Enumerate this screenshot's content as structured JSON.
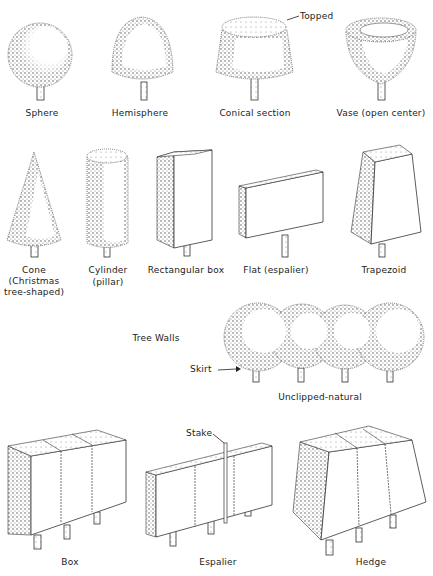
{
  "diagram": {
    "rows": [
      {
        "row": 1,
        "shapes": [
          {
            "id": "sphere",
            "label": "Sphere"
          },
          {
            "id": "hemisphere",
            "label": "Hemisphere"
          },
          {
            "id": "conical-section",
            "label": "Conical section",
            "callout": "Topped"
          },
          {
            "id": "vase",
            "label": "Vase (open center)"
          }
        ]
      },
      {
        "row": 2,
        "shapes": [
          {
            "id": "cone",
            "label": "Cone",
            "sublabel1": "(Christmas",
            "sublabel2": "tree-shaped)"
          },
          {
            "id": "cylinder",
            "label": "Cylinder",
            "sublabel1": "(pillar)"
          },
          {
            "id": "rectangular-box",
            "label": "Rectangular box"
          },
          {
            "id": "flat",
            "label": "Flat (espalier)"
          },
          {
            "id": "trapezoid",
            "label": "Trapezoid"
          }
        ]
      },
      {
        "row": 3,
        "section_title": "Tree Walls",
        "shapes": [
          {
            "id": "unclipped-natural",
            "label": "Unclipped-natural",
            "callout": "Skirt"
          }
        ]
      },
      {
        "row": 4,
        "shapes": [
          {
            "id": "box",
            "label": "Box"
          },
          {
            "id": "espalier",
            "label": "Espalier",
            "callout": "Stake"
          },
          {
            "id": "hedge",
            "label": "Hedge"
          }
        ]
      }
    ],
    "colors": {
      "ink": "#222222",
      "stipple": "#555555",
      "background": "#ffffff"
    }
  }
}
